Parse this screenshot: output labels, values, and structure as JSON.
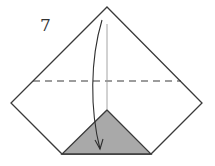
{
  "step": {
    "number": "7"
  },
  "colors": {
    "outline": "#3a3a3a",
    "fill_paper": "#ffffff",
    "fill_shaded": "#a9a9a9",
    "guide_line": "#9a9a9a",
    "arrow": "#2e2e2e"
  },
  "shape": {
    "kind": "pentagon-kite",
    "points": {
      "top": [
        107,
        7
      ],
      "left": [
        11,
        103
      ],
      "right": [
        202,
        103
      ],
      "bottom_left": [
        62,
        154
      ],
      "bottom_right": [
        151,
        154
      ]
    }
  },
  "shaded_triangle": {
    "apex": [
      107,
      110
    ],
    "base_left": [
      62,
      154
    ],
    "base_right": [
      151,
      154
    ]
  },
  "fold_line": {
    "style": "valley-dashed",
    "y": 81,
    "x_start": 33,
    "x_end": 181
  },
  "center_line": {
    "x": 107,
    "y_start": 24,
    "y_end": 110
  },
  "arrow": {
    "direction": "down",
    "meaning": "fold top point down"
  }
}
